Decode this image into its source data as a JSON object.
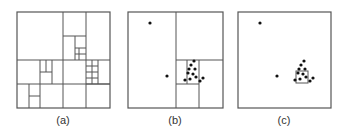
{
  "figure": {
    "line_color": "#555555",
    "point_color": "#111111",
    "panels": [
      {
        "id": "a",
        "caption": "(a)",
        "frame": [
          17,
          12,
          110,
          108
        ],
        "lines": [
          [
            17,
            60,
            110,
            60
          ],
          [
            17,
            84,
            110,
            84
          ],
          [
            63,
            12,
            63,
            108
          ],
          [
            86,
            12,
            86,
            108
          ],
          [
            63,
            36,
            86,
            36
          ],
          [
            75,
            36,
            75,
            60
          ],
          [
            75,
            48,
            86,
            48
          ],
          [
            79,
            48,
            79,
            60
          ],
          [
            75,
            54,
            86,
            54
          ],
          [
            40,
            60,
            40,
            84
          ],
          [
            52,
            60,
            52,
            84
          ],
          [
            40,
            72,
            52,
            72
          ],
          [
            46,
            60,
            46,
            72
          ],
          [
            29,
            84,
            29,
            108
          ],
          [
            40,
            84,
            40,
            108
          ],
          [
            29,
            96,
            40,
            96
          ],
          [
            86,
            84,
            110,
            84
          ],
          [
            98,
            60,
            98,
            84
          ],
          [
            86,
            66,
            98,
            66
          ],
          [
            86,
            72,
            98,
            72
          ],
          [
            86,
            78,
            98,
            78
          ],
          [
            92,
            60,
            92,
            84
          ]
        ],
        "points": []
      },
      {
        "id": "b",
        "caption": "(b)",
        "frame": [
          128,
          12,
          223,
          108
        ],
        "lines": [
          [
            176,
            12,
            176,
            108
          ],
          [
            176,
            60,
            223,
            60
          ],
          [
            176,
            84,
            199,
            84
          ],
          [
            199,
            60,
            199,
            108
          ],
          [
            187,
            60,
            187,
            84
          ]
        ],
        "points": [
          [
            150,
            23
          ],
          [
            167,
            76
          ],
          [
            194,
            61
          ],
          [
            191,
            65
          ],
          [
            189,
            69
          ],
          [
            195,
            69
          ],
          [
            188,
            73
          ],
          [
            193,
            74
          ],
          [
            190,
            79
          ],
          [
            196,
            77
          ],
          [
            185,
            80
          ],
          [
            200,
            81
          ],
          [
            203,
            78
          ]
        ]
      },
      {
        "id": "c",
        "caption": "(c)",
        "frame": [
          238,
          12,
          331,
          108
        ],
        "lines": [],
        "box": [
          296,
          71,
          308,
          83
        ],
        "points": [
          [
            260,
            23
          ],
          [
            277,
            76
          ],
          [
            304,
            61
          ],
          [
            301,
            65
          ],
          [
            299,
            69
          ],
          [
            305,
            69
          ],
          [
            298,
            73
          ],
          [
            303,
            74
          ],
          [
            300,
            79
          ],
          [
            306,
            77
          ],
          [
            295,
            80
          ],
          [
            310,
            81
          ],
          [
            313,
            78
          ]
        ]
      }
    ]
  }
}
